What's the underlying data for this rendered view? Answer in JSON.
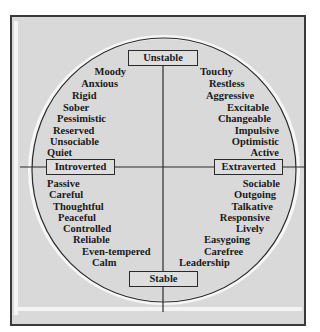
{
  "diagram": {
    "axes": {
      "top": "Unstable",
      "bottom": "Stable",
      "left": "Introverted",
      "right": "Extraverted"
    },
    "quadrants": {
      "unstable_introverted": [
        "Moody",
        "Anxious",
        "Rigid",
        "Sober",
        "Pessimistic",
        "Reserved",
        "Unsociable",
        "Quiet"
      ],
      "unstable_extraverted": [
        "Touchy",
        "Restless",
        "Aggressive",
        "Excitable",
        "Changeable",
        "Impulsive",
        "Optimistic",
        "Active"
      ],
      "stable_introverted": [
        "Passive",
        "Careful",
        "Thoughtful",
        "Peaceful",
        "Controlled",
        "Reliable",
        "Even-tempered",
        "Calm"
      ],
      "stable_extraverted": [
        "Sociable",
        "Outgoing",
        "Talkative",
        "Responsive",
        "Lively",
        "Easygoing",
        "Carefree",
        "Leadership"
      ]
    },
    "colors": {
      "background": "#d9d9d9",
      "line": "#2a2a2a",
      "text": "#1a1a1a"
    }
  }
}
